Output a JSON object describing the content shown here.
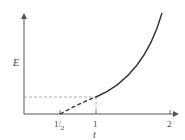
{
  "diagram": {
    "y_axis_label": "E",
    "x_axis_label": "t",
    "x_ticks": [
      {
        "label": "1/2",
        "value": 0.5
      },
      {
        "label": "1",
        "value": 1
      },
      {
        "label": "2",
        "value": 2
      }
    ],
    "curve": {
      "description": "Increasing convex curve; dashed from t=1/2 (E=0) to t=1, solid from t=1 upward",
      "dashed_segment": {
        "from_t": 0.5,
        "to_t": 1
      },
      "solid_segment": {
        "from_t": 1,
        "to_t": 1.85
      }
    },
    "guides": {
      "horizontal_dashed_at_t": 1,
      "vertical_dashed_at_t": 1
    },
    "colors": {
      "axis": "#555555",
      "curve": "#333333",
      "guide": "#999999"
    }
  }
}
